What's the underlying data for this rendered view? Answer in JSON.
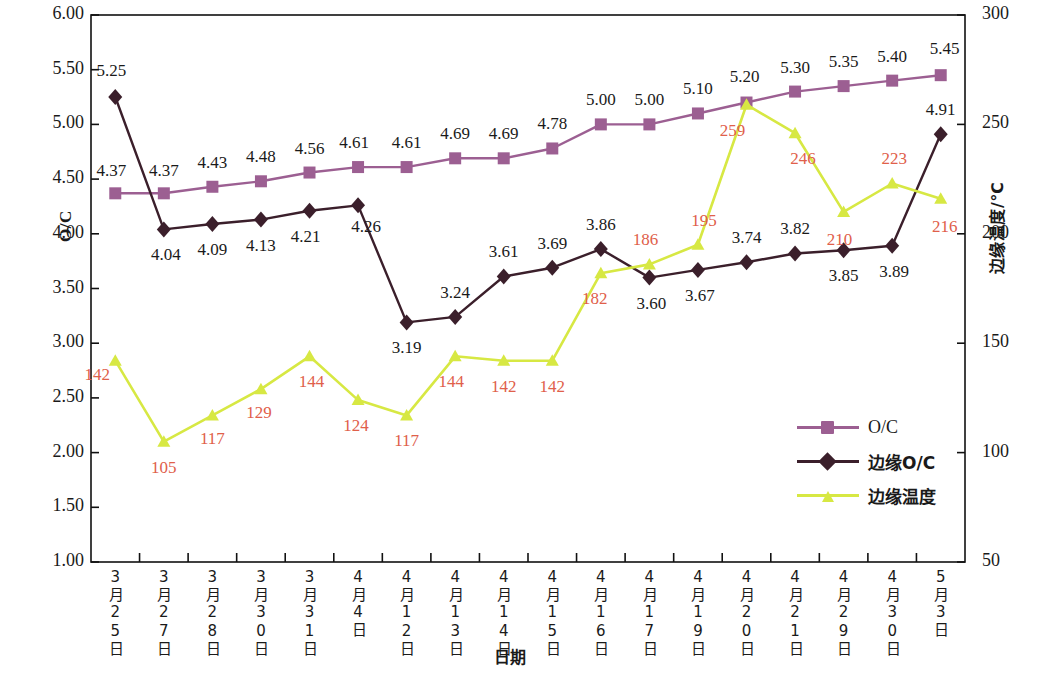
{
  "chart_data": {
    "type": "line",
    "title": "",
    "xlabel": "日期",
    "ylabel": "O/C",
    "y2label": "边缘温度/℃",
    "ylim": [
      1.0,
      6.0
    ],
    "ytick_step": 0.5,
    "y2lim": [
      50,
      300
    ],
    "y2tick_step": 50,
    "grid": false,
    "legend_position": "inside-right-bottom",
    "yticks_left": [
      "6.00",
      "5.50",
      "5.00",
      "4.50",
      "4.00",
      "3.50",
      "3.00",
      "2.50",
      "2.00",
      "1.50",
      "1.00"
    ],
    "yticks_right": [
      "300",
      "250",
      "200",
      "150",
      "100",
      "50"
    ],
    "categories": [
      "3月25日",
      "3月27日",
      "3月28日",
      "3月30日",
      "3月31日",
      "4月4日",
      "4月12日",
      "4月13日",
      "4月14日",
      "4月15日",
      "4月16日",
      "4月17日",
      "4月19日",
      "4月20日",
      "4月21日",
      "4月29日",
      "4月30日",
      "5月3日"
    ],
    "series": [
      {
        "name": "O/C",
        "axis": "left",
        "color": "#9c5f92",
        "marker": "square",
        "values": [
          4.37,
          4.37,
          4.43,
          4.48,
          4.56,
          4.61,
          4.61,
          4.69,
          4.69,
          4.78,
          5.0,
          5.0,
          5.1,
          5.2,
          5.3,
          5.35,
          5.4,
          5.45
        ],
        "labels": [
          "4.37",
          "4.37",
          "4.43",
          "4.48",
          "4.56",
          "4.61",
          "4.61",
          "4.69",
          "4.69",
          "4.78",
          "5.00",
          "5.00",
          "5.10",
          "5.20",
          "5.30",
          "5.35",
          "5.40",
          "5.45"
        ]
      },
      {
        "name": "边缘O/C",
        "axis": "left",
        "color": "#3b1f2b",
        "marker": "diamond",
        "values": [
          5.25,
          4.04,
          4.09,
          4.13,
          4.21,
          4.26,
          3.19,
          3.24,
          3.61,
          3.69,
          3.86,
          3.6,
          3.67,
          3.74,
          3.82,
          3.85,
          3.89,
          4.91
        ],
        "labels": [
          "5.25",
          "4.04",
          "4.09",
          "4.13",
          "4.21",
          "4.26",
          "3.19",
          "3.24",
          "3.61",
          "3.69",
          "3.86",
          "3.60",
          "3.67",
          "3.74",
          "3.82",
          "3.85",
          "3.89",
          "4.91"
        ]
      },
      {
        "name": "边缘温度",
        "axis": "right",
        "color": "#d7e843",
        "marker": "triangle",
        "values": [
          142,
          105,
          117,
          129,
          144,
          124,
          117,
          144,
          142,
          142,
          182,
          186,
          195,
          259,
          246,
          210,
          223,
          216
        ],
        "labels": [
          "142",
          "105",
          "117",
          "129",
          "144",
          "124",
          "117",
          "144",
          "142",
          "142",
          "182",
          "186",
          "195",
          "259",
          "246",
          "210",
          "223",
          "216"
        ]
      }
    ]
  },
  "legend": {
    "items": [
      {
        "label": "O/C"
      },
      {
        "label": "边缘O/C"
      },
      {
        "label": "边缘温度"
      }
    ]
  }
}
